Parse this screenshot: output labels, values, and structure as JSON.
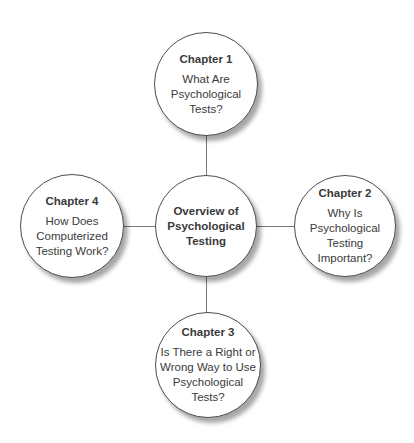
{
  "diagram": {
    "center_node": {
      "title_lines": [
        "Overview of",
        "Psychological",
        "Testing"
      ]
    },
    "nodes": [
      {
        "heading": "Chapter 1",
        "body_lines": [
          "What Are",
          "Psychological",
          "Tests?"
        ]
      },
      {
        "heading": "Chapter 2",
        "body_lines": [
          "Why Is",
          "Psychological",
          "Testing",
          "Important?"
        ]
      },
      {
        "heading": "Chapter 3",
        "body_lines": [
          "Is There a Right or",
          "Wrong Way to Use",
          "Psychological",
          "Tests?"
        ]
      },
      {
        "heading": "Chapter 4",
        "body_lines": [
          "How Does",
          "Computerized",
          "Testing Work?"
        ]
      }
    ],
    "colors": {
      "circle_border": "#4d4d4d",
      "circle_fill": "#ffffff",
      "connector_line": "#7a7a7a",
      "text": "#3a3a3a",
      "shadow": "rgba(0,0,0,0.35)"
    }
  }
}
